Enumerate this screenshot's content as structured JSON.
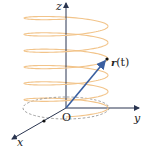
{
  "diagram": {
    "labels": {
      "z_axis": "z",
      "y_axis": "y",
      "x_axis": "x",
      "origin": "O",
      "position_vector_bold": "r",
      "position_vector_arg": "(t)"
    },
    "colors": {
      "helix": "#f2c48a",
      "axes": "#2a3550",
      "vector": "#3a5fa0",
      "dashed_ellipse": "#888888"
    },
    "helix_turns": 6
  }
}
